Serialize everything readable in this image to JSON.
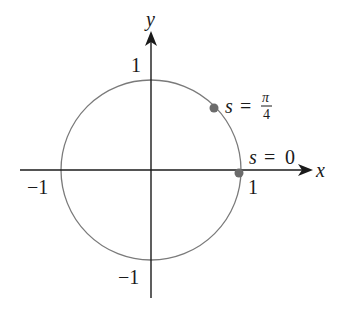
{
  "figure": {
    "axes": {
      "x_label": "x",
      "y_label": "y",
      "x_ticks": [
        {
          "value": -1,
          "label": "−1"
        },
        {
          "value": 1,
          "label": "1"
        }
      ],
      "y_ticks": [
        {
          "value": 1,
          "label": "1"
        },
        {
          "value": -1,
          "label": "−1"
        }
      ]
    },
    "circle": {
      "center": [
        0,
        0
      ],
      "radius": 1,
      "stroke_color": "#7a7a7a"
    },
    "points": [
      {
        "name": "s-zero",
        "s_var": "s",
        "eq": "=",
        "value": "0",
        "coords": [
          1,
          0
        ],
        "color": "#6b6b6b"
      },
      {
        "name": "s-pi-over-4",
        "s_var": "s",
        "eq": "=",
        "numerator": "π",
        "denominator": "4",
        "coords": [
          0.7071,
          0.7071
        ],
        "color": "#6b6b6b"
      }
    ],
    "colors": {
      "axis": "#1a1a1a",
      "circle": "#7a7a7a",
      "point": "#6b6b6b",
      "text": "#1a1a1a"
    }
  }
}
